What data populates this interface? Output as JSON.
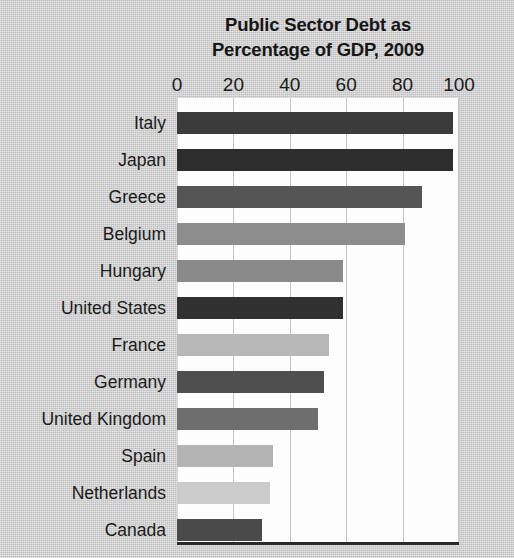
{
  "chart_data": {
    "type": "bar",
    "orientation": "horizontal",
    "title": "Public Sector Debt as Percentage of GDP, 2009",
    "title_lines": [
      "Public Sector Debt as",
      "Percentage of GDP, 2009"
    ],
    "xlabel": "",
    "ylabel": "",
    "xlim": [
      0,
      100
    ],
    "xticks": [
      0,
      20,
      40,
      60,
      80,
      100
    ],
    "xtick_labels": [
      "0",
      "20",
      "40",
      "60",
      "80",
      "100"
    ],
    "grid": true,
    "grid_axis": "x",
    "legend": false,
    "categories": [
      "Italy",
      "Japan",
      "Greece",
      "Belgium",
      "Hungary",
      "United States",
      "France",
      "Germany",
      "United Kingdom",
      "Spain",
      "Netherlands",
      "Canada"
    ],
    "values": [
      98,
      98,
      87,
      81,
      59,
      59,
      54,
      52,
      50,
      34,
      33,
      30
    ],
    "bar_colors": [
      "#3b3b3b",
      "#2d2d2d",
      "#555555",
      "#8d8d8d",
      "#8a8a8a",
      "#303030",
      "#b8b8b8",
      "#4f4f4f",
      "#6e6e6e",
      "#b4b4b4",
      "#cbcbcb",
      "#4a4a4a"
    ],
    "plot_background": "#fdfdfd",
    "page_background": "#c9c9c9",
    "axis_line_color": "#2a2a2a",
    "gridline_color": "#c4c4c4"
  }
}
